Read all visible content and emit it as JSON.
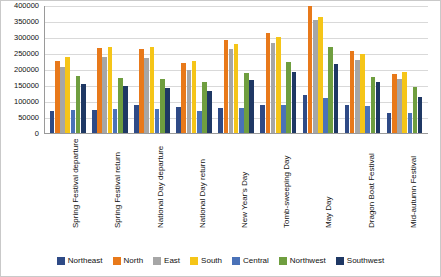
{
  "chart_data": {
    "type": "bar",
    "title": "",
    "xlabel": "",
    "ylabel": "",
    "ylim": [
      0,
      400000
    ],
    "ytick_step": 50000,
    "grid": true,
    "legend_position": "bottom",
    "yticks": [
      "0",
      "50000",
      "100000",
      "150000",
      "200000",
      "250000",
      "300000",
      "350000",
      "400000"
    ],
    "categories": [
      "Spring Festival departure",
      "Spring Festival return",
      "National Day departure",
      "National Day return",
      "New Year's Day",
      "Tomb-sweeping Day",
      "May Day",
      "Dragon Boat Festival",
      "Mid-autumn Festival"
    ],
    "series": [
      {
        "name": "Northeast",
        "color": "#2e4a86",
        "values": [
          70000,
          72000,
          88000,
          82000,
          78000,
          88000,
          118000,
          88000,
          62000
        ]
      },
      {
        "name": "North",
        "color": "#e8791a",
        "values": [
          225000,
          265000,
          262000,
          218000,
          292000,
          312000,
          398000,
          255000,
          185000
        ]
      },
      {
        "name": "East",
        "color": "#a6a6a6",
        "values": [
          205000,
          238000,
          235000,
          196000,
          262000,
          280000,
          352000,
          228000,
          168000
        ]
      },
      {
        "name": "South",
        "color": "#f5c518",
        "values": [
          238000,
          268000,
          268000,
          225000,
          278000,
          300000,
          362000,
          248000,
          192000
        ]
      },
      {
        "name": "Central",
        "color": "#4a72b8",
        "values": [
          72000,
          74000,
          76000,
          70000,
          78000,
          88000,
          108000,
          85000,
          62000
        ]
      },
      {
        "name": "Northwest",
        "color": "#6f9e3f",
        "values": [
          178000,
          172000,
          168000,
          160000,
          188000,
          222000,
          268000,
          175000,
          145000
        ]
      },
      {
        "name": "Southwest",
        "color": "#1f3864",
        "values": [
          152000,
          148000,
          142000,
          132000,
          165000,
          192000,
          215000,
          158000,
          112000
        ]
      }
    ]
  }
}
